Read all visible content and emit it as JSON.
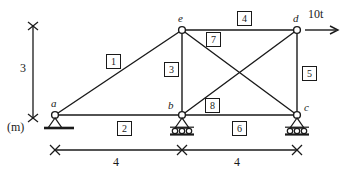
{
  "diagram": {
    "stroke_color": "#1a1a1a",
    "background_color": "#ffffff"
  },
  "nodes": [
    {
      "id": "a",
      "label": "a",
      "x": 55,
      "y": 115,
      "support": "pin",
      "label_dx": -4,
      "label_dy": -17
    },
    {
      "id": "b",
      "label": "b",
      "x": 182,
      "y": 115,
      "support": "roller",
      "label_dx": -14,
      "label_dy": -15
    },
    {
      "id": "c",
      "label": "c",
      "x": 297,
      "y": 115,
      "support": "roller",
      "label_dx": 7,
      "label_dy": -13
    },
    {
      "id": "d",
      "label": "d",
      "x": 297,
      "y": 30,
      "support": "none",
      "label_dx": -4,
      "label_dy": -17
    },
    {
      "id": "e",
      "label": "e",
      "x": 182,
      "y": 30,
      "support": "none",
      "label_dx": -4,
      "label_dy": -17
    }
  ],
  "members": [
    {
      "id": "1",
      "label": "1",
      "from": "a",
      "to": "e",
      "box_x": 106,
      "box_y": 54
    },
    {
      "id": "2",
      "label": "2",
      "from": "a",
      "to": "b",
      "box_x": 117,
      "box_y": 121
    },
    {
      "id": "3",
      "label": "3",
      "from": "e",
      "to": "b",
      "box_x": 164,
      "box_y": 62
    },
    {
      "id": "4",
      "label": "4",
      "from": "e",
      "to": "d",
      "box_x": 237,
      "box_y": 11
    },
    {
      "id": "5",
      "label": "5",
      "from": "d",
      "to": "c",
      "box_x": 302,
      "box_y": 66
    },
    {
      "id": "6",
      "label": "6",
      "from": "b",
      "to": "c",
      "box_x": 232,
      "box_y": 121
    },
    {
      "id": "7",
      "label": "7",
      "from": "e",
      "to": "c",
      "box_x": 206,
      "box_y": 32
    },
    {
      "id": "8",
      "label": "8",
      "from": "b",
      "to": "d",
      "box_x": 205,
      "box_y": 98
    }
  ],
  "load": {
    "label": "10t",
    "label_x": 308,
    "label_y": 8,
    "arrow_from_x": 305,
    "arrow_to_x": 338,
    "arrow_y": 30,
    "applied_at": "d"
  },
  "dimensions": {
    "vertical": {
      "label": "3",
      "label_x": 20,
      "label_y": 62,
      "line_x": 33,
      "y_top": 26,
      "y_bottom": 118
    },
    "unit": {
      "label": "(m)",
      "label_x": 7,
      "label_y": 121
    },
    "horizontal": {
      "line_y": 150,
      "ticks_x": [
        55,
        182,
        297
      ],
      "segments": [
        {
          "label": "4",
          "label_x": 113,
          "label_y": 156
        },
        {
          "label": "4",
          "label_x": 234,
          "label_y": 156
        }
      ]
    }
  }
}
